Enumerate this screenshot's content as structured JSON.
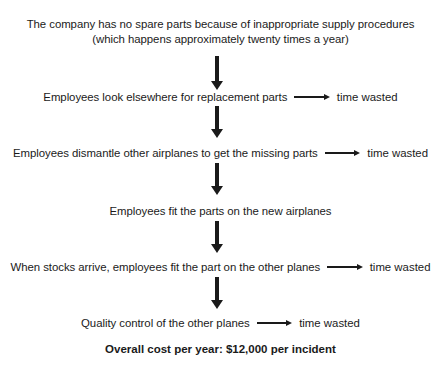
{
  "diagram": {
    "title_lines": [
      "The company has no spare parts because of inappropriate supply procedures",
      "(which happens approximately twenty times a year)"
    ],
    "steps": [
      {
        "text": "Employees look elsewhere for replacement parts",
        "side_label": "time wasted",
        "has_side_arrow": true
      },
      {
        "text": "Employees dismantle other airplanes to get the missing parts",
        "side_label": "time wasted",
        "has_side_arrow": true
      },
      {
        "text": "Employees fit the parts on the new airplanes",
        "side_label": "",
        "has_side_arrow": false
      },
      {
        "text": "When stocks arrive, employees fit the part on the other planes",
        "side_label": "time wasted",
        "has_side_arrow": true
      },
      {
        "text": "Quality control of the other planes",
        "side_label": "time wasted",
        "has_side_arrow": true
      }
    ],
    "total": "Overall cost per year: $12,000 per incident",
    "colors": {
      "text": "#1a1a1a",
      "background": "#ffffff",
      "arrow": "#1a1a1a"
    }
  }
}
